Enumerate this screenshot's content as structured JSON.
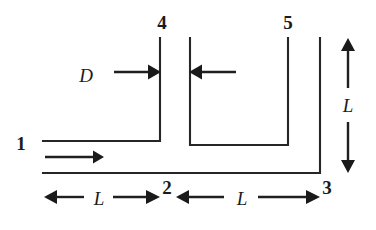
{
  "figure": {
    "kind": "duct-flow-schematic",
    "background_color": "#ffffff",
    "line_color": "#262626",
    "label_color": "#1b1b1b"
  },
  "stations": [
    {
      "id": "1",
      "label": "1",
      "x": 21,
      "y": 150,
      "role": "inlet"
    },
    {
      "id": "2",
      "label": "2",
      "x": 167,
      "y": 195,
      "role": "mid-bottom"
    },
    {
      "id": "3",
      "label": "3",
      "x": 327,
      "y": 195,
      "role": "outlet-bottom"
    },
    {
      "id": "4",
      "label": "4",
      "x": 162,
      "y": 28,
      "role": "top-left-opening"
    },
    {
      "id": "5",
      "label": "5",
      "x": 288,
      "y": 28,
      "role": "top-right-opening"
    }
  ],
  "dimensions": [
    {
      "id": "D",
      "label": "D",
      "orientation": "horizontal",
      "description": "duct width between inner walls",
      "text_x": 86,
      "text_y": 82
    },
    {
      "id": "L-bottom-left",
      "label": "L",
      "orientation": "horizontal",
      "description": "length from inlet to station 2",
      "text_x": 97,
      "text_y": 208
    },
    {
      "id": "L-bottom-right",
      "label": "L",
      "orientation": "horizontal",
      "description": "length from station 2 to station 3",
      "text_x": 242,
      "text_y": 208
    },
    {
      "id": "L-right-vertical",
      "label": "L",
      "orientation": "vertical",
      "description": "height of the riser at the right side",
      "text_x": 348,
      "text_y": 112
    }
  ],
  "flow": {
    "inlet_arrow": {
      "label": "",
      "direction": "right",
      "from_x": 45,
      "to_x": 102,
      "y": 157
    }
  },
  "geometry": {
    "left_riser_inner_x": 160,
    "left_riser_outer_x": 190,
    "right_riser_inner_x": 288,
    "right_riser_outer_x": 320,
    "top_y": 38,
    "channel_bottom_y": 145,
    "inlet_top_y": 141,
    "inlet_bottom_y": 173,
    "inlet_left_x": 43
  }
}
